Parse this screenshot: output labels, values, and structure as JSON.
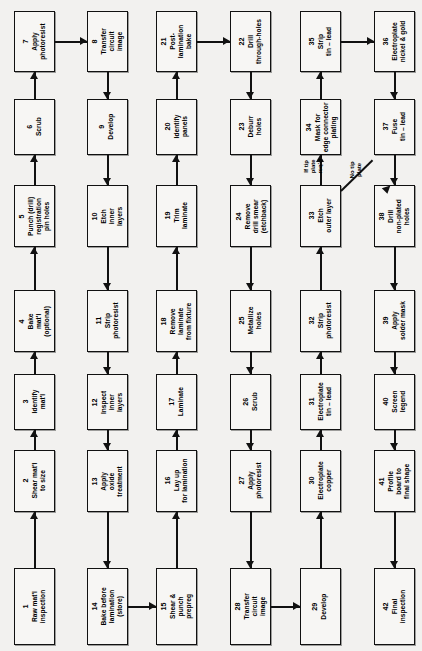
{
  "diagram": {
    "orientation": "rotated-90",
    "box_fill": "#f7f6f4",
    "box_stroke": "#111111",
    "background": "#f2f1ef"
  },
  "nodes": [
    {
      "num": "1",
      "label": "Raw mat'l\ninspection",
      "col": 1,
      "row": 1
    },
    {
      "num": "2",
      "label": "Shear mat'l\nto size",
      "col": 1,
      "row": 2
    },
    {
      "num": "3",
      "label": "Identify\nmat'l",
      "col": 1,
      "row": 3
    },
    {
      "num": "4",
      "label": "Bake\nmat'l\n(optional)",
      "col": 1,
      "row": 4
    },
    {
      "num": "5",
      "label": "Punch (drill)\nregistration\npin holes",
      "col": 1,
      "row": 5
    },
    {
      "num": "6",
      "label": "Scrub",
      "col": 1,
      "row": 6
    },
    {
      "num": "7",
      "label": "Apply\nphotoresist",
      "col": 1,
      "row": 7
    },
    {
      "num": "8",
      "label": "Transfer\ncircuit\nimage",
      "col": 2,
      "row": 7
    },
    {
      "num": "9",
      "label": "Develop",
      "col": 2,
      "row": 6
    },
    {
      "num": "10",
      "label": "Etch\ninner\nlayers",
      "col": 2,
      "row": 5
    },
    {
      "num": "11",
      "label": "Strip\nphotoresist",
      "col": 2,
      "row": 4
    },
    {
      "num": "12",
      "label": "Inspect\ninner\nlayers",
      "col": 2,
      "row": 3
    },
    {
      "num": "13",
      "label": "Apply\noxide\ntreatment",
      "col": 2,
      "row": 2
    },
    {
      "num": "14",
      "label": "Bake before\nlamination\n(store)",
      "col": 2,
      "row": 1
    },
    {
      "num": "15",
      "label": "Shear &\npunch\nprepreg",
      "col": 3,
      "row": 1
    },
    {
      "num": "16",
      "label": "Lay up\nfor lamination",
      "col": 3,
      "row": 2
    },
    {
      "num": "17",
      "label": "Laminate",
      "col": 3,
      "row": 3
    },
    {
      "num": "18",
      "label": "Remove\nlaminate\nfrom fixture",
      "col": 3,
      "row": 4
    },
    {
      "num": "19",
      "label": "Trim\nlaminate",
      "col": 3,
      "row": 5
    },
    {
      "num": "20",
      "label": "Identify\npanels",
      "col": 3,
      "row": 6
    },
    {
      "num": "21",
      "label": "Post-\nlamination\nbake",
      "col": 3,
      "row": 7
    },
    {
      "num": "22",
      "label": "Drill\nthrough-holes",
      "col": 4,
      "row": 7
    },
    {
      "num": "23",
      "label": "Deburr\nholes",
      "col": 4,
      "row": 6
    },
    {
      "num": "24",
      "label": "Remove\ndrill  smear\n(etchback)",
      "col": 4,
      "row": 5
    },
    {
      "num": "25",
      "label": "Metallize\nholes",
      "col": 4,
      "row": 4
    },
    {
      "num": "26",
      "label": "Scrub",
      "col": 4,
      "row": 3
    },
    {
      "num": "27",
      "label": "Apply\nphotoresist",
      "col": 4,
      "row": 2
    },
    {
      "num": "28",
      "label": "Transfer\ncircuit\nimage",
      "col": 4,
      "row": 1
    },
    {
      "num": "29",
      "label": "Develop",
      "col": 5,
      "row": 1
    },
    {
      "num": "30",
      "label": "Electroplate\ncopper",
      "col": 5,
      "row": 2
    },
    {
      "num": "31",
      "label": "Electroplate\ntin – lead",
      "col": 5,
      "row": 3
    },
    {
      "num": "32",
      "label": "Strip\nphotoresist",
      "col": 5,
      "row": 4
    },
    {
      "num": "33",
      "label": "Etch\nouter layer",
      "col": 5,
      "row": 5
    },
    {
      "num": "34",
      "label": "Mask for\nedge connector\nplating",
      "col": 5,
      "row": 6
    },
    {
      "num": "35",
      "label": "Strip\ntin – lead",
      "col": 5,
      "row": 7
    },
    {
      "num": "36",
      "label": "Electroplate\nnickel & gold",
      "col": 6,
      "row": 7
    },
    {
      "num": "37",
      "label": "Fuse\ntin – lead",
      "col": 6,
      "row": 6
    },
    {
      "num": "38",
      "label": "Drill\nnon-plated\nholes",
      "col": 6,
      "row": 5
    },
    {
      "num": "39",
      "label": "Apply\nsolder mask",
      "col": 6,
      "row": 4
    },
    {
      "num": "40",
      "label": "Screen\nlegend",
      "col": 6,
      "row": 3
    },
    {
      "num": "41",
      "label": "Profile\nboard to\nfinal shape",
      "col": 6,
      "row": 2
    },
    {
      "num": "42",
      "label": "Final\ninspection",
      "col": 6,
      "row": 1
    }
  ],
  "edge_labels": [
    {
      "id": "if-tip-plate",
      "text": "If tip\nplate\nreq'd"
    },
    {
      "id": "no-tip-plate",
      "text": "No tip\nplate"
    }
  ]
}
